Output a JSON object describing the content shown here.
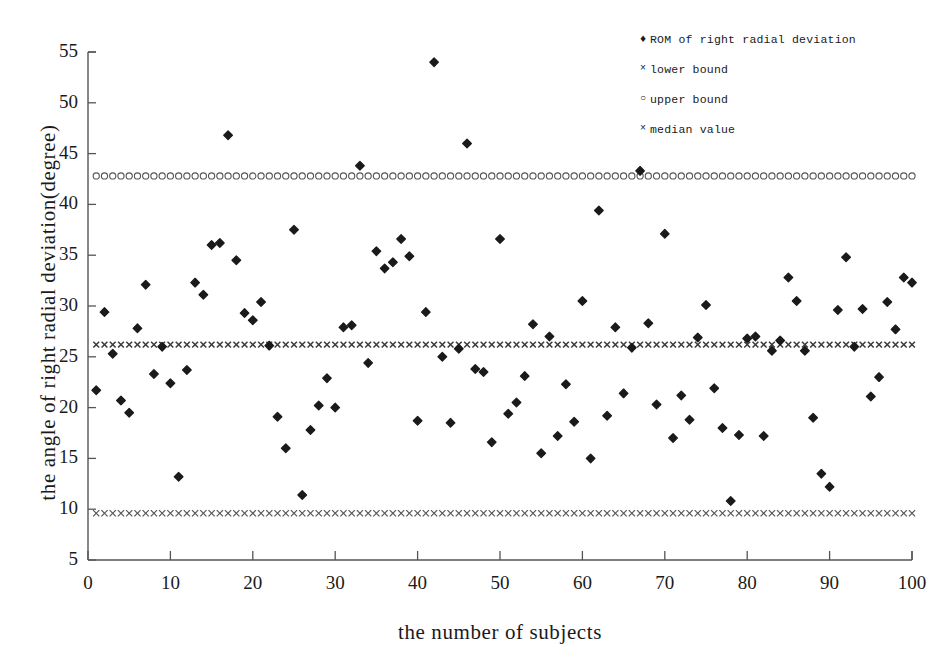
{
  "chart_data": {
    "type": "scatter",
    "title": "",
    "xlabel": "the number of subjects",
    "ylabel": "the angle of right radial deviation(degree)",
    "xlim": [
      0,
      100
    ],
    "ylim": [
      5,
      55
    ],
    "xticks": [
      0,
      10,
      20,
      30,
      40,
      50,
      60,
      70,
      80,
      90,
      100
    ],
    "yticks": [
      5,
      10,
      15,
      20,
      25,
      30,
      35,
      40,
      45,
      50,
      55
    ],
    "grid": false,
    "legend_position": "top-right",
    "marker_color": "#1a1a1a",
    "axis_color": "#555555",
    "series": [
      {
        "name": "ROM of right radial deviation",
        "marker": "diamond",
        "x": [
          1,
          2,
          3,
          4,
          5,
          6,
          7,
          8,
          9,
          10,
          11,
          12,
          13,
          14,
          15,
          16,
          17,
          18,
          19,
          20,
          21,
          22,
          23,
          24,
          25,
          26,
          27,
          28,
          29,
          30,
          31,
          32,
          33,
          34,
          35,
          36,
          37,
          38,
          39,
          40,
          41,
          42,
          43,
          44,
          45,
          46,
          47,
          48,
          49,
          50,
          51,
          52,
          53,
          54,
          55,
          56,
          57,
          58,
          59,
          60,
          61,
          62,
          63,
          64,
          65,
          66,
          67,
          68,
          69,
          70,
          71,
          72,
          73,
          74,
          75,
          76,
          77,
          78,
          79,
          80,
          81,
          82,
          83,
          84,
          85,
          86,
          87,
          88,
          89,
          90,
          91,
          92,
          93,
          94,
          95,
          96,
          97,
          98,
          99,
          100
        ],
        "values": [
          21.7,
          29.4,
          25.3,
          20.7,
          19.5,
          27.8,
          32.1,
          23.3,
          26.0,
          22.4,
          13.2,
          23.7,
          32.3,
          31.1,
          36.0,
          36.2,
          46.8,
          34.5,
          29.3,
          28.6,
          30.4,
          26.1,
          19.1,
          16.0,
          37.5,
          11.4,
          17.8,
          20.2,
          22.9,
          20.0,
          27.9,
          28.1,
          43.8,
          24.4,
          35.4,
          33.7,
          34.3,
          36.6,
          34.9,
          18.7,
          29.4,
          54.0,
          25.0,
          18.5,
          25.8,
          46.0,
          23.8,
          23.5,
          16.6,
          36.6,
          19.4,
          20.5,
          23.1,
          28.2,
          15.5,
          27.0,
          17.2,
          22.3,
          18.6,
          30.5,
          15.0,
          39.4,
          19.2,
          27.9,
          21.4,
          25.9,
          43.3,
          28.3,
          20.3,
          37.1,
          17.0,
          21.2,
          18.8,
          26.9,
          30.1,
          21.9,
          18.0,
          10.8,
          17.3,
          26.8,
          27.0,
          17.2,
          25.6,
          26.6,
          32.8,
          30.5,
          25.6,
          19.0,
          13.5,
          12.2,
          29.6,
          34.8,
          26.0,
          29.7,
          21.1,
          23.0,
          30.4,
          27.7,
          32.8,
          32.3
        ]
      },
      {
        "name": "upper bound",
        "marker": "circle",
        "value": 42.8
      },
      {
        "name": "median value",
        "marker": "cross-bold",
        "value": 26.2
      },
      {
        "name": "lower bound",
        "marker": "cross",
        "value": 9.6
      }
    ]
  },
  "legend": {
    "items": [
      {
        "marker": "♦",
        "marker_class": "diamond",
        "label": "ROM of right radial deviation"
      },
      {
        "marker": "×",
        "marker_class": "cross",
        "label": "lower bound"
      },
      {
        "marker": "○",
        "marker_class": "circle",
        "label": "upper bound"
      },
      {
        "marker": "×",
        "marker_class": "cross",
        "label": "median value"
      }
    ]
  },
  "axes": {
    "y_title": "the angle of right radial deviation(degree)",
    "x_title": "the number of subjects",
    "y_tick_labels": [
      "55",
      "50",
      "45",
      "40",
      "35",
      "30",
      "25",
      "20",
      "15",
      "10",
      "5"
    ],
    "x_tick_labels": [
      "0",
      "10",
      "20",
      "30",
      "40",
      "50",
      "60",
      "70",
      "80",
      "90",
      "100"
    ]
  }
}
